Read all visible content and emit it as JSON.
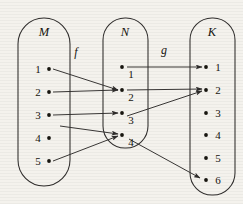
{
  "diagram": {
    "background_color": "#f4f2ed",
    "stroke_color": "#2e2c2b",
    "sets": [
      {
        "id": "M",
        "label": "M",
        "label_x": 44,
        "label_y": 36,
        "oval": {
          "x": 18,
          "y": 18,
          "width": 52,
          "height": 168,
          "rx": 26
        },
        "label_side": "left",
        "elements": [
          {
            "label": "1",
            "x": 49,
            "y": 69
          },
          {
            "label": "2",
            "x": 49,
            "y": 92
          },
          {
            "label": "3",
            "x": 49,
            "y": 115
          },
          {
            "label": "4",
            "x": 49,
            "y": 138
          },
          {
            "label": "5",
            "x": 49,
            "y": 161
          }
        ]
      },
      {
        "id": "N",
        "label": "N",
        "label_x": 125,
        "label_y": 36,
        "oval": {
          "x": 103,
          "y": 18,
          "width": 45,
          "height": 130,
          "rx": 22
        },
        "label_side": "right-below",
        "elements": [
          {
            "label": "1",
            "x": 122,
            "y": 67
          },
          {
            "label": "2",
            "x": 122,
            "y": 90
          },
          {
            "label": "3",
            "x": 122,
            "y": 113
          },
          {
            "label": "4",
            "x": 122,
            "y": 135
          }
        ]
      },
      {
        "id": "K",
        "label": "K",
        "label_x": 212,
        "label_y": 36,
        "oval": {
          "x": 190,
          "y": 18,
          "width": 45,
          "height": 177,
          "rx": 22
        },
        "label_side": "right",
        "elements": [
          {
            "label": "1",
            "x": 206,
            "y": 67
          },
          {
            "label": "2",
            "x": 206,
            "y": 90
          },
          {
            "label": "3",
            "x": 206,
            "y": 113
          },
          {
            "label": "4",
            "x": 206,
            "y": 135
          },
          {
            "label": "5",
            "x": 206,
            "y": 158
          },
          {
            "label": "6",
            "x": 206,
            "y": 180
          }
        ]
      }
    ],
    "functions": [
      {
        "id": "f",
        "label": "f",
        "label_x": 76,
        "label_y": 56,
        "from": "M",
        "to": "N"
      },
      {
        "id": "g",
        "label": "g",
        "label_x": 164,
        "label_y": 54,
        "from": "N",
        "to": "K"
      }
    ],
    "mappings": [
      {
        "function": "f",
        "from": "M1",
        "to": "N2",
        "x1": 53,
        "y1": 69,
        "x2": 118,
        "y2": 90
      },
      {
        "function": "f",
        "from": "M2",
        "to": "N2",
        "x1": 53,
        "y1": 92,
        "x2": 118,
        "y2": 90
      },
      {
        "function": "f",
        "from": "M3",
        "to": "N3",
        "x1": 53,
        "y1": 115,
        "x2": 118,
        "y2": 113
      },
      {
        "function": "f",
        "from": "M4",
        "to": "N4",
        "x1": 60,
        "y1": 126,
        "x2": 118,
        "y2": 134
      },
      {
        "function": "f",
        "from": "M5",
        "to": "N4",
        "x1": 53,
        "y1": 161,
        "x2": 118,
        "y2": 136
      },
      {
        "function": "g",
        "from": "N1",
        "to": "K1",
        "x1": 127,
        "y1": 67,
        "x2": 202,
        "y2": 67
      },
      {
        "function": "g",
        "from": "N2",
        "to": "K2",
        "x1": 127,
        "y1": 90,
        "x2": 202,
        "y2": 89
      },
      {
        "function": "g",
        "from": "N3",
        "to": "K2",
        "x1": 127,
        "y1": 116,
        "x2": 202,
        "y2": 91
      },
      {
        "function": "g",
        "from": "N4",
        "to": "K6",
        "x1": 129,
        "y1": 139,
        "x2": 200,
        "y2": 178
      }
    ]
  }
}
